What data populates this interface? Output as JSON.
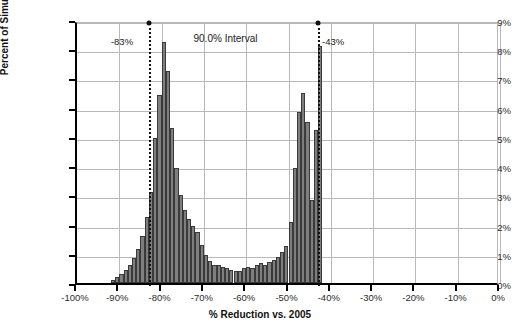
{
  "chart_data": {
    "type": "bar",
    "title": "",
    "subtitle": "",
    "xlabel": "% Reduction vs. 2005",
    "ylabel": "Percent of Simulations",
    "xlim": [
      -100,
      0
    ],
    "ylim": [
      0,
      9
    ],
    "grid": true,
    "legend_position": "none",
    "bin_width": 1,
    "x_ticks": [
      "-100%",
      "-90%",
      "-80%",
      "-70%",
      "-60%",
      "-50%",
      "-40%",
      "-30%",
      "-20%",
      "-10%",
      "0%"
    ],
    "x_tick_values": [
      -100,
      -90,
      -80,
      -70,
      -60,
      -50,
      -40,
      -30,
      -20,
      -10,
      0
    ],
    "y_ticks": [
      "0%",
      "1%",
      "2%",
      "3%",
      "4%",
      "5%",
      "6%",
      "7%",
      "8%",
      "9%"
    ],
    "y_tick_values": [
      0,
      1,
      2,
      3,
      4,
      5,
      6,
      7,
      8,
      9
    ],
    "bar_color": "#7e7e7e",
    "bar_edge_color": "#3a3a3a",
    "annotations": [
      {
        "name": "lower-bound",
        "label": "-83%",
        "x": -83,
        "kind": "interval-bound"
      },
      {
        "name": "upper-bound",
        "label": "-43%",
        "x": -43,
        "kind": "interval-bound"
      },
      {
        "name": "interval-span",
        "label": "90.0% Interval",
        "x": -63,
        "kind": "interval-span"
      }
    ],
    "x": [
      -92,
      -91,
      -90,
      -89,
      -88,
      -87,
      -86,
      -85,
      -84,
      -83,
      -82,
      -81,
      -80,
      -79,
      -78,
      -77,
      -76,
      -75,
      -74,
      -73,
      -72,
      -71,
      -70,
      -69,
      -68,
      -67,
      -66,
      -65,
      -64,
      -63,
      -62,
      -61,
      -60,
      -59,
      -58,
      -57,
      -56,
      -55,
      -54,
      -53,
      -52,
      -51,
      -50,
      -49,
      -48,
      -47,
      -46,
      -45,
      -44,
      -43,
      -42
    ],
    "values": [
      0.12,
      0.2,
      0.3,
      0.45,
      0.62,
      0.85,
      1.15,
      1.6,
      2.25,
      3.1,
      4.95,
      6.45,
      8.25,
      7.25,
      5.3,
      3.95,
      3.0,
      2.5,
      2.2,
      1.95,
      1.75,
      1.3,
      0.95,
      0.75,
      0.62,
      0.6,
      0.55,
      0.5,
      0.45,
      0.4,
      0.42,
      0.5,
      0.55,
      0.5,
      0.6,
      0.68,
      0.62,
      0.72,
      0.8,
      0.9,
      1.05,
      1.25,
      2.1,
      3.95,
      5.85,
      6.5,
      5.5,
      2.85,
      5.25,
      8.1,
      0.0
    ]
  },
  "axes": {
    "y_title": "Percent of Simulations",
    "x_title": "% Reduction vs. 2005"
  },
  "footer": {
    "cutoff_text": ""
  }
}
